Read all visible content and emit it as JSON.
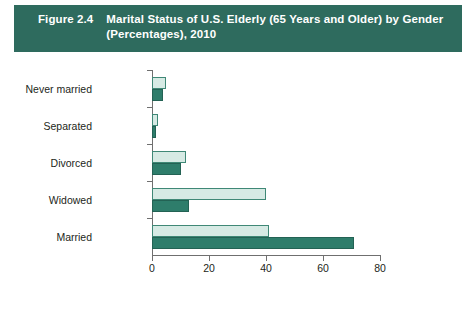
{
  "header": {
    "figure_number": "Figure 2.4",
    "title": "Marital Status of U.S. Elderly (65 Years and Older) by Gender (Percentages), 2010",
    "title_line1": "Marital Status of U.S. Elderly (65 Years and Older) by Gender",
    "title_line2": "(Percentages), 2010",
    "band_color": "#2e6b5e",
    "text_color": "#ffffff"
  },
  "colors": {
    "women": "#d6eae4",
    "men": "#2e7d6b",
    "axis": "#6f6f6f",
    "text": "#231f20"
  },
  "legend": {
    "items": [
      {
        "label": "Women",
        "swatch": "women"
      },
      {
        "label": "Men",
        "swatch": "men"
      }
    ]
  },
  "chart_data": {
    "type": "bar",
    "orientation": "horizontal",
    "title": "Marital Status of U.S. Elderly (65 Years and Older) by Gender (Percentages), 2010",
    "xlabel": "",
    "ylabel": "",
    "categories": [
      "Never married",
      "Separated",
      "Divorced",
      "Widowed",
      "Married"
    ],
    "series": [
      {
        "name": "Women",
        "color": "#d6eae4",
        "values": [
          5,
          2,
          12,
          40,
          41
        ]
      },
      {
        "name": "Men",
        "color": "#2e7d6b",
        "values": [
          4,
          1.5,
          10,
          13,
          71
        ]
      }
    ],
    "xlim": [
      0,
      80
    ],
    "xticks": [
      0,
      20,
      40,
      60,
      80
    ],
    "xtick_labels": [
      "0",
      "20",
      "40",
      "60",
      "80"
    ],
    "grid": false,
    "legend_position": "bottom-center"
  }
}
